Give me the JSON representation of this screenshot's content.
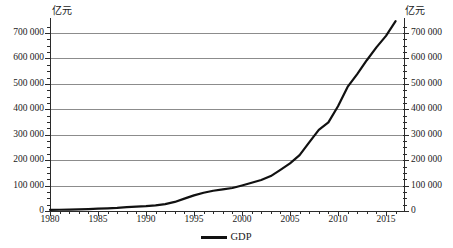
{
  "chart_data": {
    "type": "line",
    "title": "",
    "subtitle": "",
    "xlabel": "",
    "ylabel": "亿元",
    "ylabel_right": "亿元",
    "unit_left": "亿元",
    "unit_right": "亿元",
    "xlim": [
      1980,
      2017
    ],
    "ylim": [
      0,
      750000
    ],
    "grid": true,
    "grid_axis": "y",
    "legend_position": "bottom",
    "legend": [
      "GDP"
    ],
    "y_ticks": [
      0,
      100000,
      200000,
      300000,
      400000,
      500000,
      600000,
      700000
    ],
    "y_tick_labels": [
      "0",
      "100 000",
      "200 000",
      "300 000",
      "400 000",
      "500 000",
      "600 000",
      "700 000"
    ],
    "y_ticks_right": [
      0,
      100000,
      200000,
      300000,
      400000,
      500000,
      600000,
      700000
    ],
    "y_tick_labels_right": [
      "0",
      "100 000",
      "200 000",
      "300 000",
      "400 000",
      "500 000",
      "600 000",
      "700 000"
    ],
    "x_ticks": [
      1980,
      1985,
      1990,
      1995,
      2000,
      2005,
      2010,
      2015
    ],
    "x_tick_labels": [
      "1980",
      "1985",
      "1990",
      "1995",
      "2000",
      "2005",
      "2010",
      "2015"
    ],
    "x_minor_tick_step": 1,
    "y_minor_tick_step": 25000,
    "line_color": "#111111",
    "grid_color": "#8c8c8c",
    "axis_color": "#2b2b2b",
    "series": [
      {
        "name": "GDP",
        "color": "#111111",
        "x": [
          1980,
          1981,
          1982,
          1983,
          1984,
          1985,
          1986,
          1987,
          1988,
          1989,
          1990,
          1991,
          1992,
          1993,
          1994,
          1995,
          1996,
          1997,
          1998,
          1999,
          2000,
          2001,
          2002,
          2003,
          2004,
          2005,
          2006,
          2007,
          2008,
          2009,
          2010,
          2011,
          2012,
          2013,
          2014,
          2015,
          2016,
          2017
        ],
        "values": [
          4588,
          4936,
          5373,
          6021,
          7279,
          9099,
          10376,
          12175,
          15181,
          17180,
          18873,
          22006,
          27195,
          35674,
          48638,
          61340,
          71814,
          79715,
          85196,
          90564,
          100280,
          110863,
          121717,
          137422,
          161840,
          187319,
          219439,
          270092,
          319245,
          348518,
          412119,
          487940,
          538580,
          592963,
          643563,
          688858,
          746395,
          820754
        ]
      }
    ]
  },
  "legend_item": {
    "label": "GDP",
    "marker": "line-marker"
  }
}
